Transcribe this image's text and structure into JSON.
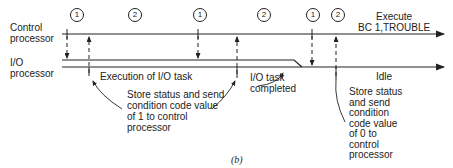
{
  "lanes": {
    "control_label": "Control\nprocessor",
    "io_label": "I/O\nprocessor"
  },
  "phases": [
    {
      "label": "1"
    },
    {
      "label": "2"
    },
    {
      "label": "1"
    },
    {
      "label": "2"
    },
    {
      "label": "1"
    },
    {
      "label": "2"
    }
  ],
  "annotations": {
    "execute": "Execute\nBC 1,TROUBLE",
    "execution_io": "Execution of I/O task",
    "io_completed": "I/O task\ncompleted",
    "idle": "Idle",
    "store_cc1": "Store status and send\ncondition code value\nof 1 to control\nprocessor",
    "store_cc0": "Store status\nand send\ncondition\ncode value\nof 0 to\ncontrol\nprocessor"
  },
  "caption": "(b)"
}
